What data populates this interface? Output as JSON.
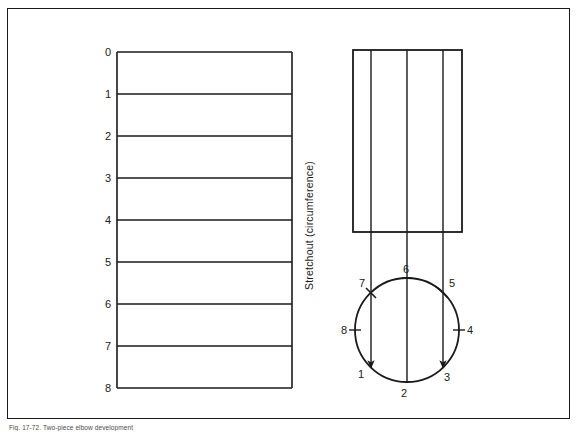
{
  "figure": {
    "caption": "Fig. 17-72. Two-piece elbow development",
    "border_color": "#1a1a1a",
    "line_color": "#1a1a1a",
    "background": "#ffffff"
  },
  "stretchout": {
    "axis_label": "Stretchout  (circumference)",
    "divisions": 8,
    "row_labels": [
      "0",
      "1",
      "2",
      "3",
      "4",
      "5",
      "6",
      "7",
      "8"
    ],
    "left": 117,
    "right": 292,
    "top": 52,
    "bottom": 388
  },
  "front_view": {
    "left": 353,
    "right": 462,
    "top": 50,
    "bottom": 232,
    "internal_lines": [
      377,
      405,
      434
    ]
  },
  "plan_view": {
    "center_x": 407,
    "center_y": 330,
    "radius": 52,
    "points": [
      {
        "label": "1",
        "x": 371,
        "y": 368,
        "text_x": 361,
        "text_y": 378
      },
      {
        "label": "2",
        "x": 407,
        "y": 382,
        "text_x": 404,
        "text_y": 397
      },
      {
        "label": "3",
        "x": 443,
        "y": 368,
        "text_x": 444,
        "text_y": 381
      },
      {
        "label": "4",
        "x": 459,
        "y": 330,
        "text_x": 466,
        "text_y": 334
      },
      {
        "label": "5",
        "x": 443,
        "y": 293,
        "text_x": 447,
        "text_y": 286
      },
      {
        "label": "6",
        "x": 407,
        "y": 278,
        "text_x": 403,
        "text_y": 272
      },
      {
        "label": "7",
        "x": 371,
        "y": 293,
        "text_x": 360,
        "text_y": 286
      },
      {
        "label": "8",
        "x": 355,
        "y": 330,
        "text_x": 342,
        "text_y": 334
      }
    ],
    "projection_lines": [
      371,
      407,
      443
    ]
  }
}
